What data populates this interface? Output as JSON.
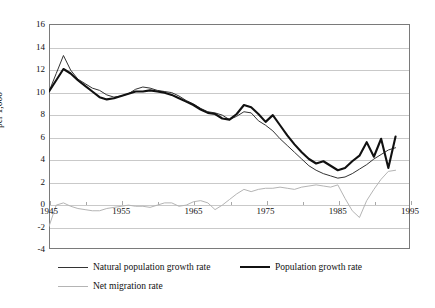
{
  "chart_data": {
    "type": "line",
    "title": "",
    "xlabel": "",
    "ylabel": "per 1,000",
    "xlim": [
      1945,
      1995
    ],
    "ylim": [
      -4,
      16
    ],
    "yticks": [
      -4,
      -2,
      0,
      2,
      4,
      6,
      8,
      10,
      12,
      14,
      16
    ],
    "ytick_labels": [
      "-4",
      "-2",
      "0",
      "2",
      "4",
      "6",
      "8",
      "10",
      "12",
      "14",
      "16"
    ],
    "xticks": [
      1945,
      1955,
      1965,
      1975,
      1985,
      1995
    ],
    "xtick_labels": [
      "1945",
      "1955",
      "1965",
      "1975",
      "1985",
      "1995"
    ],
    "grid": "horizontal",
    "legend_position": "bottom",
    "x": [
      1945,
      1946,
      1947,
      1948,
      1949,
      1950,
      1951,
      1952,
      1953,
      1954,
      1955,
      1956,
      1957,
      1958,
      1959,
      1960,
      1961,
      1962,
      1963,
      1964,
      1965,
      1966,
      1967,
      1968,
      1969,
      1970,
      1971,
      1972,
      1973,
      1974,
      1975,
      1976,
      1977,
      1978,
      1979,
      1980,
      1981,
      1982,
      1983,
      1984,
      1985,
      1986,
      1987,
      1988,
      1989,
      1990,
      1991,
      1992,
      1993
    ],
    "series": [
      {
        "name": "Natural population growth rate",
        "color": "#333333",
        "width": 1.0,
        "values": [
          10.0,
          11.6,
          13.2,
          11.9,
          11.1,
          10.7,
          10.3,
          10.1,
          9.7,
          9.5,
          9.6,
          9.8,
          10.2,
          10.4,
          10.3,
          10.1,
          10.0,
          9.9,
          9.6,
          9.2,
          8.9,
          8.5,
          8.2,
          8.1,
          7.9,
          7.5,
          7.8,
          8.2,
          8.1,
          7.4,
          7.0,
          6.5,
          5.8,
          5.2,
          4.6,
          4.0,
          3.4,
          3.0,
          2.7,
          2.5,
          2.3,
          2.4,
          2.7,
          3.1,
          3.5,
          4.0,
          4.4,
          4.8,
          5.0
        ]
      },
      {
        "name": "Population growth rate",
        "color": "#111111",
        "width": 2.1,
        "values": [
          10.0,
          11.0,
          12.0,
          11.6,
          11.0,
          10.5,
          10.0,
          9.5,
          9.3,
          9.4,
          9.6,
          9.8,
          10.0,
          10.0,
          10.1,
          10.0,
          9.9,
          9.7,
          9.4,
          9.1,
          8.8,
          8.4,
          8.1,
          8.0,
          7.6,
          7.5,
          8.0,
          8.8,
          8.6,
          8.0,
          7.3,
          7.9,
          7.0,
          6.1,
          5.3,
          4.6,
          4.0,
          3.6,
          3.8,
          3.4,
          3.0,
          3.2,
          3.8,
          4.3,
          5.5,
          4.2,
          5.8,
          3.2,
          6.0
        ]
      },
      {
        "name": "Net migration rate",
        "color": "#b4b4b4",
        "width": 1.0,
        "values": [
          -2.0,
          -0.1,
          0.1,
          -0.2,
          -0.4,
          -0.5,
          -0.6,
          -0.6,
          -0.4,
          -0.3,
          -0.2,
          -0.1,
          -0.2,
          -0.2,
          -0.3,
          -0.1,
          0.1,
          0.1,
          -0.2,
          -0.1,
          0.2,
          0.3,
          0.1,
          -0.5,
          -0.1,
          0.4,
          0.9,
          1.3,
          1.1,
          1.3,
          1.4,
          1.4,
          1.5,
          1.4,
          1.3,
          1.5,
          1.6,
          1.7,
          1.6,
          1.5,
          1.7,
          0.5,
          -0.6,
          -1.2,
          0.3,
          1.3,
          2.2,
          2.9,
          3.0
        ]
      }
    ],
    "legend": [
      {
        "label": "Natural population growth rate",
        "color": "#333333",
        "width": 1.2
      },
      {
        "label": "Population growth rate",
        "color": "#111111",
        "width": 2.4
      },
      {
        "label": "Net migration rate",
        "color": "#b4b4b4",
        "width": 1.2
      }
    ]
  }
}
